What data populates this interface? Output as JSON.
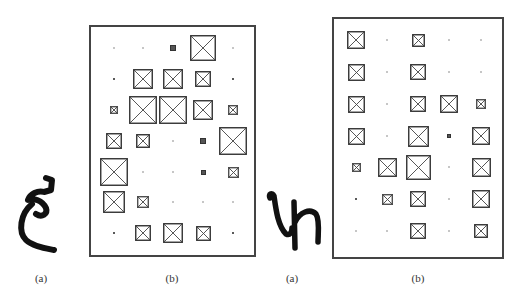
{
  "figure": {
    "captions": [
      {
        "id": "left-a",
        "text": "(a)",
        "x": 41,
        "y": 272
      },
      {
        "id": "left-b",
        "text": "(b)",
        "x": 172,
        "y": 272
      },
      {
        "id": "right-a",
        "text": "(a)",
        "x": 292,
        "y": 272
      },
      {
        "id": "right-b",
        "text": "(b)",
        "x": 418,
        "y": 272
      }
    ],
    "handwritten": [
      {
        "id": "glyph-1",
        "description": "handwritten character resembling Arabic letter ain / tilted 'e' with curl",
        "x": 10,
        "y": 175,
        "w": 45,
        "h": 80
      },
      {
        "id": "glyph-2",
        "description": "handwritten character resembling 'Ln' / 'Uh' stroke",
        "x": 265,
        "y": 190,
        "w": 60,
        "h": 60
      }
    ],
    "grids": [
      {
        "id": "grid-left",
        "box": {
          "x": 89,
          "y": 25,
          "w": 167,
          "h": 232
        },
        "col_x": [
          114,
          143,
          173,
          203,
          233
        ],
        "row_y": [
          48,
          79,
          110,
          141,
          172,
          202,
          233
        ],
        "sizes": [
          [
            1,
            1,
            6,
            26,
            1
          ],
          [
            2,
            20,
            20,
            16,
            2
          ],
          [
            8,
            28,
            28,
            20,
            10
          ],
          [
            16,
            14,
            1,
            6,
            28
          ],
          [
            28,
            1,
            1,
            5,
            11
          ],
          [
            22,
            12,
            1,
            1,
            1
          ],
          [
            2,
            16,
            20,
            15,
            2
          ]
        ]
      },
      {
        "id": "grid-right",
        "box": {
          "x": 332,
          "y": 17,
          "w": 172,
          "h": 242
        },
        "col_x": [
          356,
          387,
          418,
          449,
          481
        ],
        "row_y": [
          40,
          72,
          104,
          136,
          167,
          199,
          231
        ],
        "sizes": [
          [
            18,
            1,
            13,
            1,
            1
          ],
          [
            17,
            1,
            16,
            1,
            1
          ],
          [
            17,
            1,
            16,
            18,
            10
          ],
          [
            17,
            1,
            21,
            4,
            18
          ],
          [
            9,
            19,
            25,
            1,
            19
          ],
          [
            2,
            11,
            16,
            1,
            18
          ],
          [
            1,
            1,
            16,
            1,
            14
          ]
        ]
      }
    ],
    "colors": {
      "stroke": "#3a3a3a",
      "ink": "#111111",
      "border": "#444444"
    }
  }
}
